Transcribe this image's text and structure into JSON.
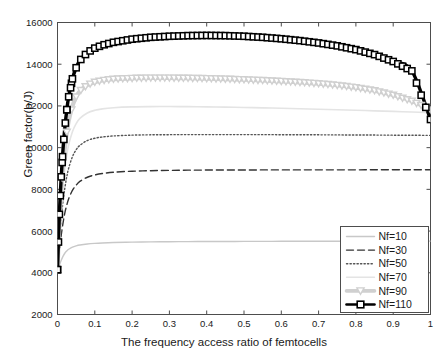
{
  "chart_data": {
    "type": "line",
    "title": "",
    "xlabel": "The frequency access ratio of femtocells",
    "ylabel": "Green factor(b/J)",
    "xlim": [
      0,
      1
    ],
    "ylim": [
      2000,
      16000
    ],
    "xticks": [
      "0",
      "0.1",
      "0.2",
      "0.3",
      "0.4",
      "0.5",
      "0.6",
      "0.7",
      "0.8",
      "0.9",
      "1"
    ],
    "xtick_values": [
      0,
      0.1,
      0.2,
      0.3,
      0.4,
      0.5,
      0.6,
      0.7,
      0.8,
      0.9,
      1
    ],
    "yticks": [
      "2000",
      "4000",
      "6000",
      "8000",
      "10000",
      "12000",
      "14000",
      "16000"
    ],
    "ytick_values": [
      2000,
      4000,
      6000,
      8000,
      10000,
      12000,
      14000,
      16000
    ],
    "grid": false,
    "legend_position": "lower right",
    "x": [
      0,
      0.005,
      0.01,
      0.015,
      0.02,
      0.025,
      0.03,
      0.04,
      0.05,
      0.06,
      0.08,
      0.1,
      0.12,
      0.15,
      0.2,
      0.25,
      0.3,
      0.35,
      0.4,
      0.45,
      0.5,
      0.55,
      0.6,
      0.65,
      0.7,
      0.75,
      0.8,
      0.85,
      0.9,
      0.95,
      1.0
    ],
    "series": [
      {
        "name": "Nf=10",
        "style": "solid",
        "color": "#c8c8c8",
        "marker": "none",
        "values": [
          4150,
          4350,
          4600,
          4800,
          4950,
          5050,
          5130,
          5230,
          5290,
          5330,
          5380,
          5410,
          5430,
          5450,
          5470,
          5480,
          5490,
          5495,
          5500,
          5502,
          5505,
          5507,
          5509,
          5510,
          5511,
          5512,
          5513,
          5514,
          5515,
          5516,
          5517
        ]
      },
      {
        "name": "Nf=30",
        "style": "dashed",
        "color": "#333333",
        "marker": "none",
        "values": [
          4150,
          5000,
          5800,
          6400,
          6900,
          7250,
          7550,
          7950,
          8200,
          8380,
          8580,
          8690,
          8760,
          8820,
          8870,
          8895,
          8910,
          8920,
          8925,
          8928,
          8930,
          8932,
          8933,
          8934,
          8935,
          8936,
          8936,
          8937,
          8937,
          8938,
          8938
        ]
      },
      {
        "name": "Nf=50",
        "style": "dotted",
        "color": "#555555",
        "marker": "none",
        "values": [
          4150,
          5500,
          6600,
          7450,
          8100,
          8620,
          9020,
          9560,
          9900,
          10110,
          10340,
          10450,
          10510,
          10560,
          10600,
          10615,
          10622,
          10625,
          10626,
          10626,
          10625,
          10623,
          10621,
          10618,
          10615,
          10611,
          10607,
          10603,
          10598,
          10593,
          10588
        ]
      },
      {
        "name": "Nf=70",
        "style": "solid",
        "color": "#e4e4e4",
        "marker": "none",
        "values": [
          4150,
          5900,
          7250,
          8280,
          9060,
          9660,
          10130,
          10760,
          11150,
          11400,
          11660,
          11790,
          11860,
          11915,
          11955,
          11968,
          11970,
          11965,
          11955,
          11942,
          11926,
          11908,
          11888,
          11866,
          11843,
          11818,
          11792,
          11765,
          11737,
          11708,
          11678
        ]
      },
      {
        "name": "Nf=90",
        "style": "solid",
        "color": "#d0d0d0",
        "marker": "triangle-down",
        "values": [
          4150,
          6350,
          7950,
          9150,
          10050,
          10740,
          11270,
          11990,
          12430,
          12710,
          13000,
          13140,
          13220,
          13285,
          13325,
          13340,
          13340,
          13330,
          13312,
          13288,
          13258,
          13222,
          13180,
          13130,
          13070,
          12990,
          12880,
          12730,
          12520,
          12230,
          11820
        ]
      },
      {
        "name": "Nf=110",
        "style": "solid",
        "color": "#000000",
        "marker": "square",
        "values": [
          4150,
          6800,
          8600,
          9980,
          11020,
          11820,
          12440,
          13300,
          13830,
          14180,
          14560,
          14770,
          14910,
          15050,
          15200,
          15290,
          15340,
          15370,
          15380,
          15370,
          15340,
          15290,
          15220,
          15130,
          15020,
          14880,
          14700,
          14460,
          14130,
          13680,
          11350
        ]
      }
    ]
  },
  "legend": {
    "items": [
      {
        "label": "Nf=10"
      },
      {
        "label": "Nf=30"
      },
      {
        "label": "Nf=50"
      },
      {
        "label": "Nf=70"
      },
      {
        "label": "Nf=90"
      },
      {
        "label": "Nf=110"
      }
    ]
  },
  "axes": {
    "x_label": "The frequency access ratio of femtocells",
    "y_label": "Green factor(b/J)"
  }
}
